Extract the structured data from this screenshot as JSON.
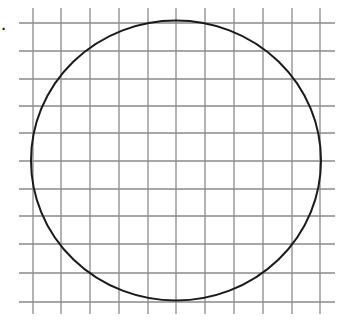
{
  "figure": {
    "label": ").",
    "grid": {
      "color": "#8a8a8a",
      "vertical_x": [
        33,
        61,
        90,
        119,
        148,
        176,
        205,
        234,
        263,
        292,
        320
      ],
      "vertical_y_range": [
        8,
        314
      ],
      "horizontal_y": [
        23,
        51,
        79,
        106,
        133,
        161,
        189,
        216,
        244,
        273,
        302
      ],
      "horizontal_x_range": [
        19,
        335
      ]
    },
    "circle": {
      "cx": 176,
      "cy": 160.5,
      "rx": 145,
      "ry": 140,
      "stroke": "#1a1a1a",
      "stroke_width": 2
    }
  }
}
